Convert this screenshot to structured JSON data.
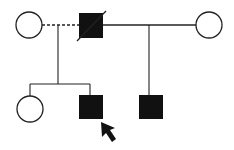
{
  "diagram": {
    "type": "pedigree",
    "colors": {
      "stroke": "#222222",
      "fill_affected": "#111111",
      "background": "#ffffff"
    },
    "generation_1": [
      {
        "id": "g1-female-left",
        "sex": "female",
        "affected": false
      },
      {
        "id": "g1-male-center",
        "sex": "male",
        "affected": true,
        "deceased": true
      },
      {
        "id": "g1-female-right",
        "sex": "female",
        "affected": false
      }
    ],
    "unions": [
      {
        "between": [
          "g1-female-left",
          "g1-male-center"
        ],
        "line": "dashed"
      },
      {
        "between": [
          "g1-male-center",
          "g1-female-right"
        ],
        "line": "solid"
      }
    ],
    "generation_2": [
      {
        "id": "g2-female",
        "sex": "female",
        "affected": false,
        "parents": "left-union"
      },
      {
        "id": "g2-male-proband",
        "sex": "male",
        "affected": true,
        "proband": true,
        "parents": "left-union"
      },
      {
        "id": "g2-male-right",
        "sex": "male",
        "affected": true,
        "parents": "right-union"
      }
    ],
    "proband_marker": "arrow"
  }
}
